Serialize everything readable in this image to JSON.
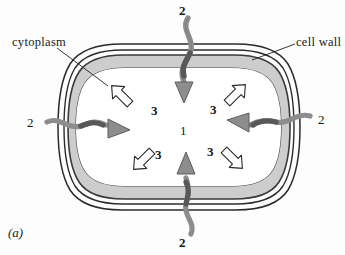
{
  "figure": {
    "panel_label": "(a)",
    "background_color": "#fdfdfd",
    "width": 345,
    "height": 255
  },
  "labels": {
    "cytoplasm": "cytoplasm",
    "cell_wall": "cell wall"
  },
  "markers": {
    "center": "1",
    "influx_top": "2",
    "influx_bottom": "2",
    "influx_left": "2",
    "influx_right": "2",
    "exchange_top_left": "3",
    "exchange_top_right": "3",
    "exchange_bottom_left": "3",
    "exchange_bottom_right": "3"
  },
  "colors": {
    "cytoplasm_band": "#cdcdcd",
    "gray_arrow_fill": "#8d8d8d",
    "gray_arrow_stroke": "#585858",
    "outline": "#2a2a2a",
    "white_arrow_fill": "#ffffff",
    "interior": "#ffffff",
    "label_text": "#1a1a1a"
  }
}
